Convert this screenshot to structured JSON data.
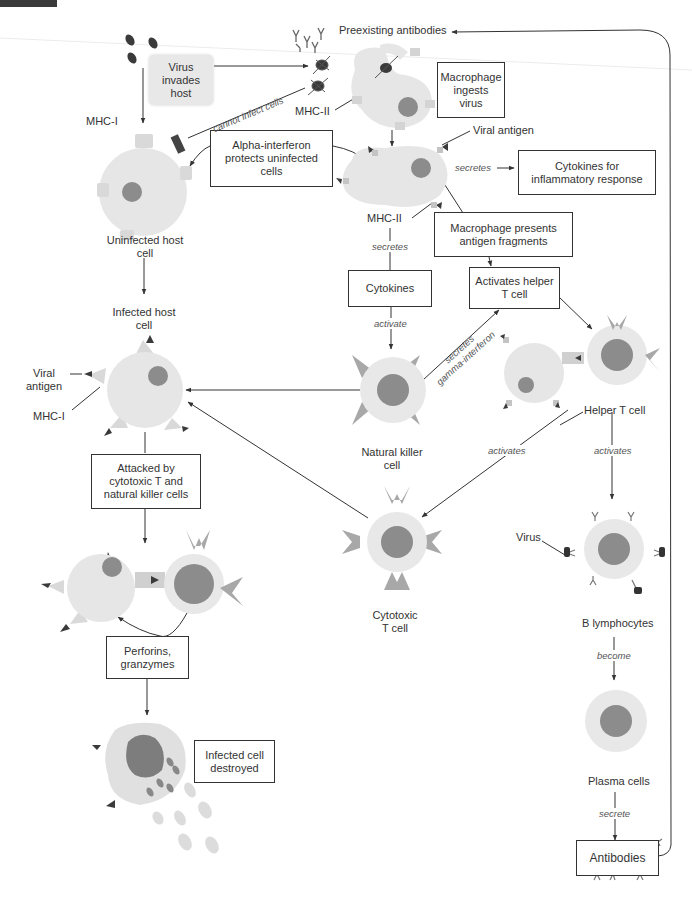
{
  "diagram": {
    "colors": {
      "cell_body": "#e6e6e6",
      "cell_ring": "#e8e8e8",
      "nucleus": "#8c8c8c",
      "receptor": "#b3b3b3",
      "antigen": "#3a3a3a",
      "box_border": "#333333",
      "line": "#333333"
    },
    "boxes": {
      "virus_invades": "Virus\ninvades\nhost",
      "macrophage_ingests": "Macrophage\ningests\nvirus",
      "alpha_interferon": "Alpha-interferon\nprotects uninfected\ncells",
      "cytokines_inflammatory": "Cytokines for\ninflammatory response",
      "macrophage_presents": "Macrophage presents\nantigen fragments",
      "cytokines": "Cytokines",
      "activates_helper": "Activates helper\nT cell",
      "attacked_by": "Attacked by\ncytotoxic T and\nnatural killer cells",
      "perforins": "Perforins,\ngranzymes",
      "infected_destroyed": "Infected cell\ndestroyed",
      "antibodies": "Antibodies"
    },
    "labels": {
      "preexisting_antibodies": "Preexisting antibodies",
      "mhc_i_top": "MHC-I",
      "mhc_ii_left": "MHC-II",
      "viral_antigen_top": "Viral antigen",
      "mhc_ii_bottom": "MHC-II",
      "uninfected_host_cell": "Uninfected host\ncell",
      "infected_host_cell": "Infected host\ncell",
      "viral_antigen_left": "Viral\nantigen",
      "mhc_i_left": "MHC-I",
      "natural_killer_cell": "Natural killer\ncell",
      "helper_t_cell": "Helper T cell",
      "cytotoxic_t_cell": "Cytotoxic\nT cell",
      "virus": "Virus",
      "b_lymphocytes": "B lymphocytes",
      "plasma_cells": "Plasma cells"
    },
    "edge_labels": {
      "cannot_infect": "cannot infect cells",
      "secretes_inflammatory": "secretes",
      "secretes_cytokines": "secretes",
      "activate": "activate",
      "secretes_gamma": "secretes",
      "gamma_interferon": "gamma-interferon",
      "activates_cytotoxic": "activates",
      "activates_b": "activates",
      "become": "become",
      "secrete": "secrete"
    }
  }
}
